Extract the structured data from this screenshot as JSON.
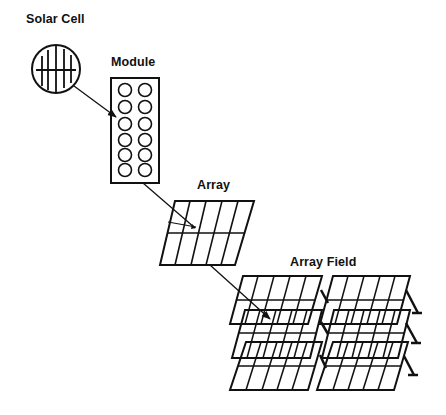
{
  "diagram": {
    "type": "photovoltaic-hierarchy",
    "stages": [
      {
        "id": "cell",
        "label": "Solar Cell"
      },
      {
        "id": "module",
        "label": "Module"
      },
      {
        "id": "array",
        "label": "Array"
      },
      {
        "id": "field",
        "label": "Array Field"
      }
    ],
    "edges": [
      {
        "from": "cell",
        "to": "module"
      },
      {
        "from": "module",
        "to": "array"
      },
      {
        "from": "array",
        "to": "field"
      }
    ],
    "colors": {
      "ink": "#111111",
      "background": "#ffffff"
    }
  }
}
